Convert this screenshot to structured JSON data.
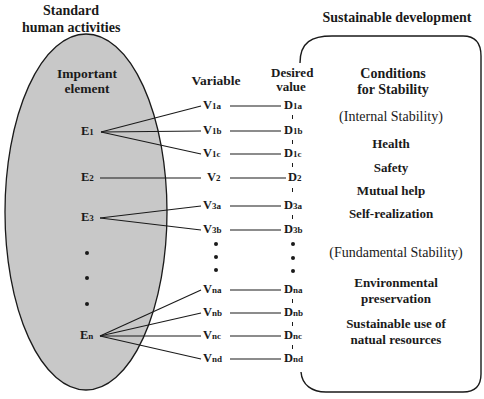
{
  "left_title": {
    "line1": "Standard",
    "line2": "human activities"
  },
  "right_title": "Sustainable development",
  "headers": {
    "important_element": {
      "line1": "Important",
      "line2": "element"
    },
    "variable": "Variable",
    "desired_value": {
      "line1": "Desired",
      "line2": "value"
    },
    "conditions": {
      "line1": "Conditions",
      "line2": "for Stability"
    }
  },
  "elements": [
    {
      "letter": "E",
      "sub": "1"
    },
    {
      "letter": "E",
      "sub": "2"
    },
    {
      "letter": "E",
      "sub": "3"
    },
    {
      "letter": "E",
      "sub": "n"
    }
  ],
  "variables": [
    {
      "letter": "V",
      "sub": "1a"
    },
    {
      "letter": "V",
      "sub": "1b"
    },
    {
      "letter": "V",
      "sub": "1c"
    },
    {
      "letter": "V",
      "sub": "2"
    },
    {
      "letter": "V",
      "sub": "3a"
    },
    {
      "letter": "V",
      "sub": "3b"
    },
    {
      "letter": "V",
      "sub": "na"
    },
    {
      "letter": "V",
      "sub": "nb"
    },
    {
      "letter": "V",
      "sub": "nc"
    },
    {
      "letter": "V",
      "sub": "nd"
    }
  ],
  "desired_values": [
    {
      "letter": "D",
      "sub": "1a"
    },
    {
      "letter": "D",
      "sub": "1b"
    },
    {
      "letter": "D",
      "sub": "1c"
    },
    {
      "letter": "D",
      "sub": "2"
    },
    {
      "letter": "D",
      "sub": "3a"
    },
    {
      "letter": "D",
      "sub": "3b"
    },
    {
      "letter": "D",
      "sub": "na"
    },
    {
      "letter": "D",
      "sub": "nb"
    },
    {
      "letter": "D",
      "sub": "nc"
    },
    {
      "letter": "D",
      "sub": "nd"
    }
  ],
  "conditions": {
    "internal_label": "(Internal Stability)",
    "internal_items": [
      "Health",
      "Safety",
      "Mutual help",
      "Self-realization"
    ],
    "fundamental_label": "(Fundamental Stability)",
    "fundamental_items": [
      {
        "line1": "Environmental",
        "line2": "preservation"
      },
      {
        "line1": "Sustainable use of",
        "line2": "natual resources"
      }
    ]
  },
  "colors": {
    "ellipse_fill": "#c8c8c8",
    "stroke": "#1a1a1a",
    "background": "#ffffff"
  }
}
